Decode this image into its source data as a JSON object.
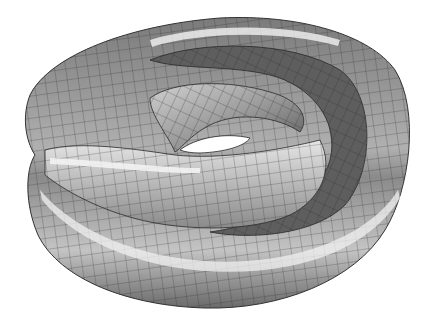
{
  "figure": {
    "background": "#ffffff",
    "surface_colors": {
      "dark": "#5a5a5a",
      "mid": "#9a9a9a",
      "light": "#c8c8c8",
      "highlight": "#ececec",
      "mesh_line": "#2a2a2a",
      "hole": "#ffffff"
    }
  }
}
